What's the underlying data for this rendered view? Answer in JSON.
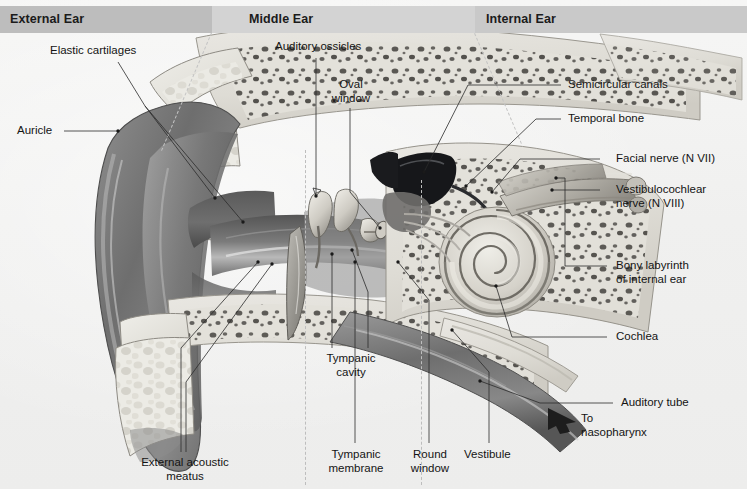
{
  "figure": {
    "background_color": "#f1f1f0",
    "band_color": "#c9c9c9",
    "label_color": "#141414",
    "leader_color": "#2b2b2b"
  },
  "regions": [
    {
      "id": "external",
      "label": "External Ear",
      "band_x": 0,
      "band_w": 212,
      "label_x": 10,
      "shade": "#bdbdbd"
    },
    {
      "id": "middle",
      "label": "Middle Ear",
      "band_x": 212,
      "band_w": 263,
      "label_x": 249,
      "shade": "#cfcfcf"
    },
    {
      "id": "internal",
      "label": "Internal Ear",
      "band_x": 475,
      "band_w": 272,
      "label_x": 486,
      "shade": "#c9c9c9"
    }
  ],
  "labels": {
    "elastic_cartilages": "Elastic cartilages",
    "auricle": "Auricle",
    "auditory_ossicles": "Auditory ossicles",
    "oval_window_l1": "Oval",
    "oval_window_l2": "window",
    "semicircular_canals": "Semicircular canals",
    "temporal_bone": "Temporal bone",
    "facial_nerve": "Facial nerve (N VII)",
    "vestibulocochlear_l1": "Vestibulocochlear",
    "vestibulocochlear_l2": "nerve (N VIII)",
    "bony_labyrinth_l1": "Bony labyrinth",
    "bony_labyrinth_l2": "of internal ear",
    "cochlea": "Cochlea",
    "auditory_tube": "Auditory tube",
    "to_nasopharynx_l1": "To",
    "to_nasopharynx_l2": "nasopharynx",
    "tympanic_cavity_l1": "Tympanic",
    "tympanic_cavity_l2": "cavity",
    "external_acoustic_l1": "External acoustic",
    "external_acoustic_l2": "meatus",
    "tympanic_membrane_l1": "Tympanic",
    "tympanic_membrane_l2": "membrane",
    "round_window_l1": "Round",
    "round_window_l2": "window",
    "vestibule": "Vestibule"
  }
}
